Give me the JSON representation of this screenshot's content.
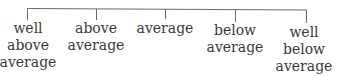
{
  "diagram": {
    "type": "rating-scale-tree",
    "line_color": "#6a6a6a",
    "categories": [
      {
        "lines": [
          "well",
          "above",
          "average"
        ],
        "x": 28
      },
      {
        "lines": [
          "above",
          "average"
        ],
        "x": 96
      },
      {
        "lines": [
          "average"
        ],
        "x": 165
      },
      {
        "lines": [
          "below",
          "average"
        ],
        "x": 235
      },
      {
        "lines": [
          "well",
          "below",
          "average"
        ],
        "x": 306
      }
    ]
  }
}
